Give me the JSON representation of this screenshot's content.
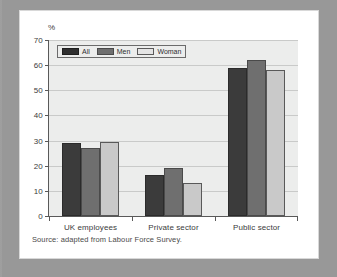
{
  "figure": {
    "background_color": "#9b9b9b",
    "card_color": "#ffffff",
    "plot_background_color": "#ecedec",
    "source_note": "Source: adapted from Labour Force Survey."
  },
  "chart_data": {
    "type": "bar",
    "title": "",
    "xlabel": "",
    "ylabel": "%",
    "ylim": [
      0,
      70
    ],
    "yticks": [
      0,
      10,
      20,
      30,
      40,
      50,
      60,
      70
    ],
    "grid": true,
    "legend_position": "top-left",
    "categories": [
      "UK employees",
      "Private sector",
      "Public sector"
    ],
    "series": [
      {
        "name": "All",
        "color": "#3b3b3b",
        "values": [
          29,
          16.5,
          59
        ]
      },
      {
        "name": "Men",
        "color": "#6f6f6f",
        "values": [
          27,
          19,
          62
        ]
      },
      {
        "name": "Woman",
        "color": "#c9c9c9",
        "values": [
          29.5,
          13,
          58
        ]
      }
    ]
  }
}
